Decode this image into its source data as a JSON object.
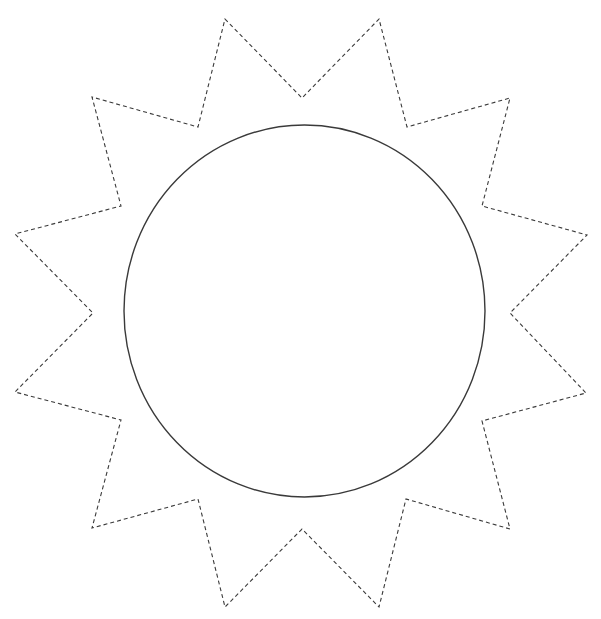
{
  "figure": {
    "width": 601,
    "height": 619,
    "background": "#ffffff",
    "stroke_color": "#3a3a3a",
    "circle": {
      "label": "sun-disc",
      "cx": 304.5,
      "cy": 311,
      "rx": 180.5,
      "ry": 186,
      "stroke_width": 1.4,
      "style": "solid"
    },
    "rays": {
      "label": "sun-rays",
      "style": "dashed",
      "dash": "4 3",
      "stroke_width": 1.1,
      "count": 14,
      "points": [
        [
          225,
          19
        ],
        [
          302,
          98
        ],
        [
          379,
          19
        ],
        [
          407,
          127
        ],
        [
          510,
          98
        ],
        [
          482,
          206
        ],
        [
          587,
          235
        ],
        [
          510,
          313
        ],
        [
          586,
          393
        ],
        [
          482,
          421
        ],
        [
          510,
          529
        ],
        [
          406,
          499
        ],
        [
          379,
          607
        ],
        [
          302,
          529
        ],
        [
          225,
          607
        ],
        [
          198,
          499
        ],
        [
          92,
          528
        ],
        [
          121,
          420
        ],
        [
          15,
          392
        ],
        [
          93,
          313
        ],
        [
          15,
          234
        ],
        [
          121,
          206
        ],
        [
          92,
          97
        ],
        [
          198,
          127
        ]
      ]
    }
  }
}
